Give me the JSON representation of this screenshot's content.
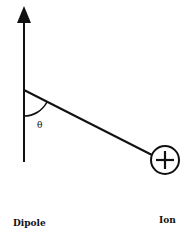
{
  "diagram": {
    "title": "",
    "labels": {
      "dipole": "Dipole",
      "ion": "Ion",
      "angle": "θ"
    },
    "ion_charge_symbol": "+",
    "elements": [
      {
        "name": "dipole-axis-arrow",
        "kind": "arrow",
        "direction": "up"
      },
      {
        "name": "dipole-ion-connector",
        "kind": "line"
      },
      {
        "name": "angle-arc",
        "kind": "arc",
        "label": "θ"
      },
      {
        "name": "ion",
        "kind": "circle",
        "symbol": "+"
      }
    ],
    "colors": {
      "stroke": "#111111",
      "background": "#ffffff"
    }
  }
}
